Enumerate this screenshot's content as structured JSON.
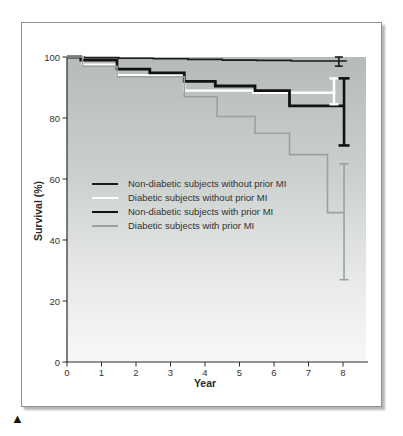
{
  "figure": {
    "marker": "▲",
    "frame_border_color": "#8e918f",
    "plot_background_top_color": "#b6bbb9",
    "plot_background_bottom_color": "#f8f9f7",
    "axis_color": "#2b2b2b"
  },
  "chart_data": {
    "type": "line",
    "subtype": "kaplan-meier-step-survival",
    "title": "",
    "xlabel": "Year",
    "ylabel": "Survival (%)",
    "xlim": [
      0,
      8.7
    ],
    "ylim": [
      0,
      100
    ],
    "xticks": [
      0,
      1,
      2,
      3,
      4,
      5,
      6,
      7,
      8
    ],
    "yticks": [
      0,
      20,
      40,
      60,
      80,
      100
    ],
    "grid": false,
    "legend_position": "middle-left",
    "series": [
      {
        "name": "Non-diabetic subjects without prior MI",
        "color": "#1b1b1b",
        "width": 1.6,
        "points": [
          [
            0,
            100
          ],
          [
            0.5,
            99.8
          ],
          [
            1.5,
            99.6
          ],
          [
            2.5,
            99.4
          ],
          [
            3.5,
            99.2
          ],
          [
            4.5,
            99.0
          ],
          [
            5.5,
            98.9
          ],
          [
            6.5,
            98.7
          ],
          [
            8.1,
            98.6
          ]
        ],
        "end_value": 98.6,
        "error_bar": {
          "x": 7.88,
          "low": 97,
          "high": 100,
          "serif": 4
        }
      },
      {
        "name": "Diabetic subjects without prior MI",
        "color": "#ffffff",
        "width": 2.4,
        "points": [
          [
            0,
            100
          ],
          [
            0.45,
            97.5
          ],
          [
            1.45,
            94.0
          ],
          [
            3.4,
            89.0
          ],
          [
            5.4,
            88.3
          ],
          [
            7.78,
            88.3
          ]
        ],
        "end_value": 88.3,
        "error_bar": {
          "x": 7.74,
          "low": 84.5,
          "high": 93,
          "serif": 4.5
        }
      },
      {
        "name": "Non-diabetic subjects with prior MI",
        "color": "#121212",
        "width": 2.8,
        "points": [
          [
            0,
            100
          ],
          [
            0.4,
            99.0
          ],
          [
            1.45,
            96.0
          ],
          [
            2.4,
            94.8
          ],
          [
            3.4,
            92.0
          ],
          [
            4.3,
            90.5
          ],
          [
            5.45,
            89.0
          ],
          [
            6.45,
            84.0
          ],
          [
            8.05,
            84.0
          ]
        ],
        "end_value": 84.0,
        "error_bar": {
          "x": 8.03,
          "low": 71,
          "high": 93,
          "serif": 5.5
        }
      },
      {
        "name": "Diabetic subjects with prior MI",
        "color": "#9ba19f",
        "width": 1.6,
        "points": [
          [
            0,
            100
          ],
          [
            0.45,
            97.0
          ],
          [
            1.45,
            93.5
          ],
          [
            3.4,
            87.0
          ],
          [
            4.35,
            80.5
          ],
          [
            5.45,
            75.0
          ],
          [
            6.45,
            68.0
          ],
          [
            7.55,
            49.0
          ],
          [
            8.05,
            49.0
          ]
        ],
        "end_value": 49.0,
        "error_bar": {
          "x": 8.03,
          "low": 27,
          "high": 65,
          "serif": 4.5
        }
      }
    ]
  }
}
